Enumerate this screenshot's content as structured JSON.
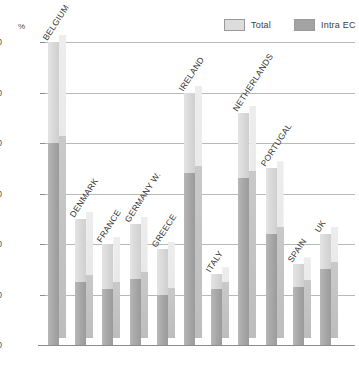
{
  "axis": {
    "unit_label": "%",
    "y_ticks": [
      "60",
      "50",
      "40",
      "30",
      "20",
      "10",
      "0"
    ],
    "y_min": 0,
    "y_max": 60
  },
  "legend": {
    "items": [
      {
        "label": "Total",
        "swatch": "legend-swatch-total",
        "color": "#dcdcdc"
      },
      {
        "label": "Intra EC",
        "swatch": "legend-swatch-intra",
        "color": "#a3a3a3"
      }
    ]
  },
  "chart_data": {
    "type": "bar",
    "title": "",
    "subtitle": "",
    "xlabel": "",
    "ylabel": "%",
    "ylim": [
      0,
      60
    ],
    "grid": true,
    "legend_position": "top-right",
    "stacked": true,
    "categories": [
      "BELGIUM",
      "DENMARK",
      "FRANCE",
      "GERMANY W.",
      "GREECE",
      "IRELAND",
      "ITALY",
      "NETHERLANDS",
      "PORTUGAL",
      "SPAIN",
      "UK"
    ],
    "series": [
      {
        "name": "Total",
        "values": [
          60,
          25,
          20,
          24,
          19,
          50,
          14,
          46,
          35,
          16,
          22
        ]
      },
      {
        "name": "Intra EC",
        "values": [
          40,
          12.5,
          11,
          13,
          10,
          34,
          11,
          33,
          22,
          11.5,
          15
        ]
      }
    ],
    "yticks": [
      0,
      10,
      20,
      30,
      40,
      50,
      60
    ]
  }
}
